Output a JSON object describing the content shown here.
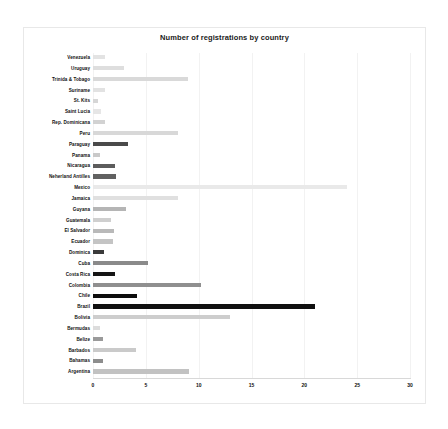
{
  "chart_data": {
    "type": "bar",
    "orientation": "horizontal",
    "title": "Number of registrations by country",
    "xlabel": "",
    "ylabel": "",
    "xlim": [
      0,
      30
    ],
    "xticks": [
      0,
      5,
      10,
      15,
      20,
      25,
      30
    ],
    "xtick_labels": [
      "0",
      "5",
      "10",
      "15",
      "20",
      "25",
      "30"
    ],
    "grid": true,
    "legend": false,
    "background": "#ffffff",
    "categories": [
      "Venezuela",
      "Uruguay",
      "Trinida & Tobago",
      "Suriname",
      "St. Kits",
      "Saint Lucia",
      "Rep. Dominicana",
      "Peru",
      "Paraguay",
      "Panama",
      "Nicaragua",
      "Neherland Antilles",
      "Mexico",
      "Jamaica",
      "Guyana",
      "Guatemala",
      "El Salvador",
      "Ecuador",
      "Dominica",
      "Cuba",
      "Costa Rica",
      "Colombia",
      "Chile",
      "Brazil",
      "Bolivia",
      "Bermudas",
      "Belize",
      "Barbados",
      "Bahamas",
      "Argentina"
    ],
    "values": [
      1.1,
      2.9,
      9.0,
      1.1,
      0.5,
      0.8,
      1.1,
      8.0,
      3.3,
      0.7,
      2.1,
      2.2,
      24.0,
      8.0,
      3.1,
      1.7,
      2.0,
      1.9,
      1.0,
      5.2,
      2.1,
      10.2,
      4.2,
      21.0,
      13.0,
      0.7,
      0.9,
      4.1,
      0.9,
      9.1
    ],
    "bar_colors": [
      "#e3e3e3",
      "#dedede",
      "#d9d9d9",
      "#e2e2e2",
      "#d6d6d6",
      "#e6e6e6",
      "#d2d2d2",
      "#d8d8d8",
      "#4a4a4a",
      "#c9c9c9",
      "#5c5c5c",
      "#616161",
      "#e9e9e9",
      "#e0e0e0",
      "#b5b5b5",
      "#cfcfcf",
      "#b9b9b9",
      "#c4c4c4",
      "#3a3a3a",
      "#8a8a8a",
      "#151515",
      "#8f8f8f",
      "#0d0d0d",
      "#101010",
      "#cdcdcd",
      "#dcdcdc",
      "#9a9a9a",
      "#cacaca",
      "#8d8d8d",
      "#c2c2c2"
    ]
  }
}
